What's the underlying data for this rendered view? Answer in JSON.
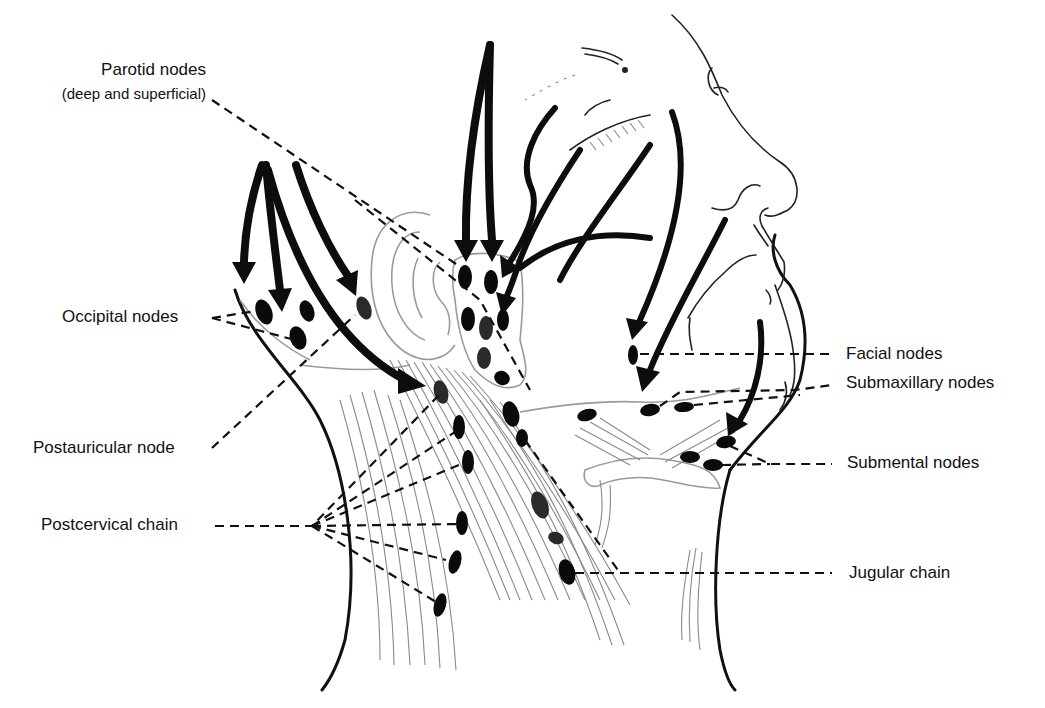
{
  "figure": {
    "background_color": "#ffffff",
    "ink_color": "#111111"
  },
  "labels": {
    "parotid": {
      "line1": "Parotid nodes",
      "line2": "(deep and superficial)"
    },
    "occipital": "Occipital nodes",
    "postauricular": "Postauricular node",
    "postcervical": "Postcervical chain",
    "facial": "Facial nodes",
    "submaxillary": "Submaxillary nodes",
    "submental": "Submental nodes",
    "jugular": "Jugular chain"
  },
  "node_groups": [
    {
      "name": "Parotid nodes",
      "count": 8
    },
    {
      "name": "Occipital nodes",
      "count": 4
    },
    {
      "name": "Postauricular node",
      "count": 1
    },
    {
      "name": "Postcervical chain",
      "count": 6
    },
    {
      "name": "Facial nodes",
      "count": 1
    },
    {
      "name": "Submaxillary nodes",
      "count": 3
    },
    {
      "name": "Submental nodes",
      "count": 3
    },
    {
      "name": "Jugular chain",
      "count": 6
    }
  ]
}
